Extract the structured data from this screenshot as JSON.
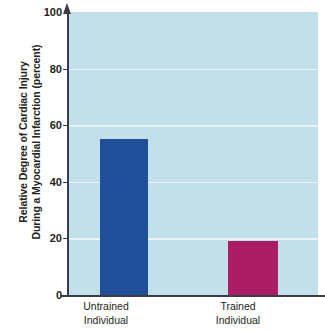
{
  "chart_data": {
    "type": "bar",
    "title": "",
    "xlabel": "",
    "ylabel": "Relative Degree of Cardiac Injury During a Myocardial Infarction (percent)",
    "ylabel_lines": [
      "Relative Degree of Cardiac Injury",
      "During a Myocardial Infarction (percent)"
    ],
    "categories": [
      "Untrained Individual",
      "Trained Individual"
    ],
    "category_lines": [
      [
        "Untrained",
        "Individual"
      ],
      [
        "Trained",
        "Individual"
      ]
    ],
    "values": [
      55,
      19
    ],
    "ylim": [
      0,
      100
    ],
    "yticks": [
      0,
      20,
      40,
      60,
      80,
      100
    ],
    "ytick_labels": [
      "0",
      "20",
      "40",
      "60",
      "80",
      "100"
    ],
    "grid": true,
    "gridlines_at": [
      20,
      40,
      60,
      80
    ],
    "legend": "none",
    "bar_colors": [
      "#21509b",
      "#ab1e66"
    ],
    "plot_background": "#c2e0ea",
    "gridline_color": "#e8f4f8",
    "axis_color": "#3c3c48",
    "text_color": "#231f20"
  },
  "axis": {
    "y_title_line1": "Relative Degree of Cardiac Injury",
    "y_title_line2": "During a Myocardial Infarction (percent)"
  },
  "ticks": [
    {
      "label": "100",
      "value": 100
    },
    {
      "label": "80",
      "value": 80
    },
    {
      "label": "60",
      "value": 60
    },
    {
      "label": "40",
      "value": 40
    },
    {
      "label": "20",
      "value": 20
    },
    {
      "label": "0",
      "value": 0
    }
  ],
  "bars": [
    {
      "line1": "Untrained",
      "line2": "Individual",
      "value": 55,
      "color": "#21509b"
    },
    {
      "line1": "Trained",
      "line2": "Individual",
      "value": 19,
      "color": "#ab1e66"
    }
  ]
}
